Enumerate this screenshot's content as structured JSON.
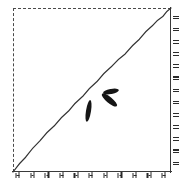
{
  "figure": {
    "title": "",
    "background_color": "#ffffff",
    "ink_color": "#2b2b2b",
    "frame": {
      "top_edge_style": "dashed",
      "left_edge_style": "dashed",
      "bottom_edge_style": "solid",
      "right_edge_style": "solid"
    }
  },
  "chart_data": {
    "type": "line",
    "title": "",
    "xlabel": "",
    "ylabel": "",
    "xlim": [
      0,
      1
    ],
    "ylim": [
      0,
      1
    ],
    "grid": false,
    "legend": null,
    "x_tick_labels": [
      "",
      "",
      "",
      "",
      "",
      "",
      "",
      "",
      "",
      "",
      ""
    ],
    "y_tick_labels": [
      "",
      "",
      "",
      "",
      "",
      "",
      "",
      "",
      "",
      "",
      "",
      "",
      ""
    ],
    "x_tick_count": 11,
    "y_tick_count": 13,
    "tick_labels_legible": false,
    "series": [
      {
        "name": "curve",
        "style": "solid",
        "color": "#333333",
        "x": [
          0.0,
          0.08,
          0.17,
          0.26,
          0.35,
          0.44,
          0.53,
          0.62,
          0.71,
          0.8,
          0.88,
          0.95,
          1.0
        ],
        "y": [
          0.0,
          0.09,
          0.19,
          0.28,
          0.37,
          0.46,
          0.55,
          0.64,
          0.72,
          0.81,
          0.89,
          0.95,
          1.0
        ]
      }
    ],
    "annotations": [
      {
        "name": "blob-1",
        "shape": "ellipse",
        "x": 0.6,
        "y": 0.52,
        "length": 16,
        "width": 5,
        "angle_deg": -11,
        "color": "#151515"
      },
      {
        "name": "blob-2",
        "shape": "ellipse",
        "x": 0.58,
        "y": 0.45,
        "length": 19,
        "width": 6,
        "angle_deg": 40,
        "color": "#151515"
      },
      {
        "name": "blob-3",
        "shape": "ellipse",
        "x": 0.48,
        "y": 0.4,
        "length": 22,
        "width": 5,
        "angle_deg": 99,
        "color": "#151515"
      }
    ]
  }
}
